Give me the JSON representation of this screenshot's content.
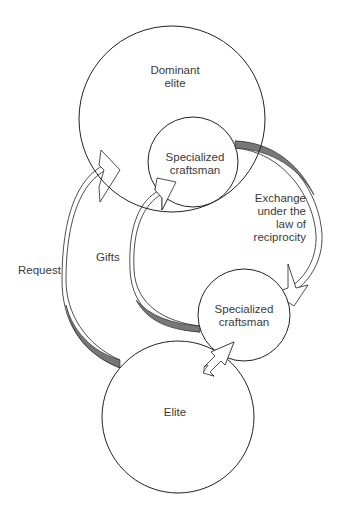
{
  "diagram": {
    "nodes": [
      {
        "id": "dominant-elite",
        "label_lines": [
          "Dominant",
          "elite"
        ]
      },
      {
        "id": "craftsman-top",
        "label_lines": [
          "Specialized",
          "craftsman"
        ]
      },
      {
        "id": "craftsman-bottom",
        "label_lines": [
          "Specialized",
          "craftsman"
        ]
      },
      {
        "id": "elite",
        "label_lines": [
          "Elite"
        ]
      }
    ],
    "edges": [
      {
        "id": "request",
        "label": "Request",
        "from": "elite",
        "to": "dominant-elite"
      },
      {
        "id": "gifts",
        "label": "Gifts",
        "from": "craftsman-bottom",
        "to": "craftsman-top"
      },
      {
        "id": "exchange",
        "label_lines": [
          "Exchange",
          "under the",
          "law of",
          "reciprocity"
        ],
        "from": "craftsman-top",
        "to": "craftsman-bottom"
      },
      {
        "id": "bidirectional",
        "label": "",
        "from": "elite",
        "to": "craftsman-bottom"
      }
    ],
    "colors": {
      "stroke": "#222222",
      "band": "#777777",
      "text": "#3a3a3a",
      "background": "#ffffff"
    }
  }
}
